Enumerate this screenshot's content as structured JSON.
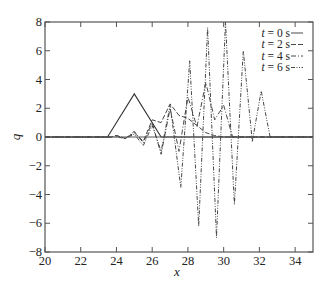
{
  "chart_data": {
    "type": "line",
    "title": "",
    "xlabel": "x",
    "ylabel": "q",
    "xlim": [
      20,
      35
    ],
    "ylim": [
      -8,
      8
    ],
    "xticks": [
      20,
      22,
      24,
      26,
      28,
      30,
      32,
      34
    ],
    "yticks": [
      -8,
      -6,
      -4,
      -2,
      0,
      2,
      4,
      6,
      8
    ],
    "grid": false,
    "legend_position": "upper right",
    "series": [
      {
        "name": "t = 0 s",
        "style": "solid",
        "x": [
          20,
          23.5,
          25,
          26.5,
          35
        ],
        "y": [
          0,
          0,
          3,
          0,
          0
        ]
      },
      {
        "name": "t = 2 s",
        "style": "dashed",
        "x": [
          20,
          23.7,
          24.0,
          24.5,
          25.0,
          25.5,
          26.0,
          26.5,
          27.0,
          27.5,
          28.0,
          28.5,
          29.0,
          29.5,
          30.0,
          30.5,
          35
        ],
        "y": [
          0,
          0,
          0.1,
          -0.1,
          0.3,
          -0.3,
          1.2,
          1.0,
          2.3,
          1.5,
          1.3,
          0.8,
          0.3,
          0.1,
          0.0,
          0.0,
          0
        ]
      },
      {
        "name": "t = 4 s",
        "style": "dash-dot",
        "x": [
          20,
          23.7,
          24.0,
          24.5,
          25.0,
          25.5,
          26.0,
          26.5,
          27.0,
          27.5,
          28.0,
          28.5,
          29.0,
          29.5,
          30.0,
          30.5,
          35
        ],
        "y": [
          0,
          0,
          0.1,
          -0.1,
          0.4,
          -0.4,
          1.0,
          -1.2,
          2.0,
          -1.0,
          2.8,
          0.7,
          3.8,
          1.2,
          2.2,
          0.0,
          0
        ]
      },
      {
        "name": "t = 6 s",
        "style": "dash-dot-dot",
        "x": [
          20,
          23.7,
          24.0,
          24.5,
          25.0,
          25.5,
          26.0,
          26.5,
          27.0,
          27.6,
          28.1,
          28.6,
          29.1,
          29.6,
          30.1,
          30.6,
          31.1,
          31.6,
          32.1,
          32.6,
          35
        ],
        "y": [
          0,
          0,
          0.0,
          -0.1,
          0.2,
          -0.6,
          0.8,
          -1.0,
          2.2,
          -3.5,
          5.3,
          -6.2,
          7.6,
          -7.0,
          8.0,
          -4.7,
          6.0,
          -0.3,
          3.2,
          0.0,
          0
        ]
      }
    ]
  },
  "legend": {
    "entries": [
      {
        "label": "t = 0 s",
        "style": "solid"
      },
      {
        "label": "t = 2 s",
        "style": "dashed"
      },
      {
        "label": "t = 4 s",
        "style": "dash-dot"
      },
      {
        "label": "t = 6 s",
        "style": "dash-dot-dot"
      }
    ]
  },
  "axes": {
    "xlabel": "x",
    "ylabel": "q",
    "xtick_labels": [
      "20",
      "22",
      "24",
      "26",
      "28",
      "30",
      "32",
      "34"
    ],
    "ytick_labels": [
      "−8",
      "−6",
      "−4",
      "−2",
      "0",
      "2",
      "4",
      "6",
      "8"
    ]
  },
  "colors": {
    "line": "#333333",
    "axis": "#555555"
  }
}
